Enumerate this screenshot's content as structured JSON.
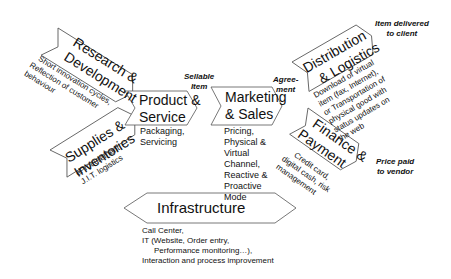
{
  "diagram": {
    "type": "value-chain",
    "nodes": {
      "research": {
        "title_line1": "Research &",
        "title_line2": "Development",
        "desc_line1": "Short innovation cycles,",
        "desc_line2": "Reflection of customer",
        "desc_line3": "behaviour"
      },
      "supplies": {
        "title_line1": "Supplies &",
        "title_line2": "Inventories",
        "desc_line1": "eProcurement,",
        "desc_line2": "J.I.T. logistics"
      },
      "product": {
        "title_line1": "Product &",
        "title_line2": "Service",
        "desc_line1": "Packaging,",
        "desc_line2": "Servicing"
      },
      "marketing": {
        "title_line1": "Marketing",
        "title_line2": "& Sales",
        "desc_lines": [
          "Pricing,",
          "Physical &",
          "Virtual",
          "Channel,",
          "Reactive &",
          "Proactive",
          "Mode"
        ]
      },
      "distribution": {
        "title_line1": "Distribution",
        "title_line2": "& Logistics",
        "desc_lines": [
          "Download of virtual",
          "item (fax, Internet),",
          "or Transportation of",
          "physical good with",
          "status updates on",
          "the web"
        ]
      },
      "finance": {
        "title_line1": "Finance &",
        "title_line2": "Payment",
        "desc_lines": [
          "Credit card,",
          "digital cash, risk",
          "management"
        ]
      },
      "infrastructure": {
        "title": "Infrastructure",
        "desc_lines": [
          "Call Center,",
          "IT (Website, Order entry,",
          "Performance monitoring…),",
          "Interaction and process improvement"
        ]
      }
    },
    "flow_labels": {
      "sellable_line1": "Sellable",
      "sellable_line2": "Item",
      "agreement_line1": "Agree-",
      "agreement_line2": "ment",
      "delivered_line1": "Item delivered",
      "delivered_line2": "to client",
      "price_line1": "Price paid",
      "price_line2": "to vendor"
    },
    "colors": {
      "stroke": "#555555",
      "fill": "#ffffff",
      "text": "#111111"
    }
  }
}
